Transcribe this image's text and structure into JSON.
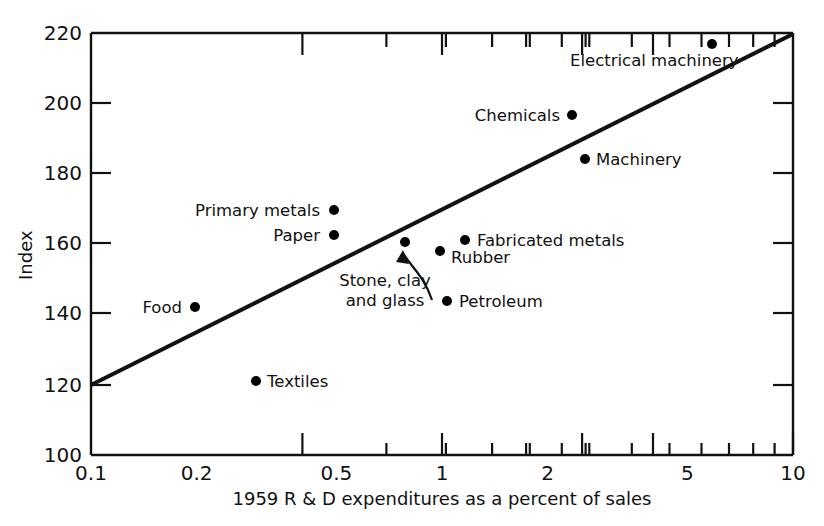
{
  "chart_data": {
    "type": "scatter",
    "title": "",
    "xlabel": "1959 R & D expenditures as a percent of sales",
    "ylabel": "Index",
    "xscale": "log",
    "yscale": "linear",
    "xlim": [
      0.1,
      10
    ],
    "ylim": [
      100,
      220
    ],
    "grid": false,
    "legend": "none",
    "xticks": [
      "0.1",
      "0.2",
      "0.5",
      "1",
      "2",
      "5",
      "10"
    ],
    "xtick_values": [
      0.1,
      0.2,
      0.5,
      1,
      2,
      5,
      10
    ],
    "xminor_ticks": [
      0.3,
      0.4,
      0.6,
      0.7,
      0.8,
      0.9,
      3,
      4,
      6,
      7,
      8,
      9
    ],
    "yticks": [
      "100",
      "120",
      "140",
      "160",
      "180",
      "200",
      "220"
    ],
    "ytick_values": [
      100,
      120,
      140,
      160,
      180,
      200,
      220
    ],
    "points": [
      {
        "label": "Electrical machinery",
        "x": 6.2,
        "y": 216.5,
        "label_side": "below"
      },
      {
        "label": "Chemicals",
        "x": 2.3,
        "y": 196,
        "label_side": "left"
      },
      {
        "label": "Machinery",
        "x": 2.55,
        "y": 183.5,
        "label_side": "right"
      },
      {
        "label": "Primary metals",
        "x": 0.5,
        "y": 170,
        "label_side": "left"
      },
      {
        "label": "Paper",
        "x": 0.5,
        "y": 163.5,
        "label_side": "left"
      },
      {
        "label": "Fabricated metals",
        "x": 1.2,
        "y": 161.5,
        "label_side": "right"
      },
      {
        "label": "Stone, clay and glass",
        "x": 0.82,
        "y": 161.5,
        "label_side": "annotation"
      },
      {
        "label": "Rubber",
        "x": 1.02,
        "y": 158.5,
        "label_side": "right"
      },
      {
        "label": "Petroleum",
        "x": 1.07,
        "y": 144,
        "label_side": "right"
      },
      {
        "label": "Food",
        "x": 0.195,
        "y": 142.8,
        "label_side": "left"
      },
      {
        "label": "Textiles",
        "x": 0.29,
        "y": 121,
        "label_side": "right"
      }
    ],
    "trendline": {
      "name": "fitted line",
      "x": [
        0.1,
        10
      ],
      "y": [
        120,
        220
      ]
    },
    "annotations": [
      {
        "text_line1": "Stone, clay",
        "text_line2": "and glass",
        "points_to": "Stone, clay and glass"
      }
    ]
  },
  "labels": {
    "y_axis_title": "Index",
    "x_axis_title": "1959 R & D expenditures as a percent of sales",
    "annotation_stone_line1": "Stone, clay",
    "annotation_stone_line2": "and glass",
    "pt_electrical_machinery": "Electrical machinery",
    "pt_chemicals": "Chemicals",
    "pt_machinery": "Machinery",
    "pt_primary_metals": "Primary metals",
    "pt_paper": "Paper",
    "pt_fabricated_metals": "Fabricated metals",
    "pt_rubber": "Rubber",
    "pt_petroleum": "Petroleum",
    "pt_food": "Food",
    "pt_textiles": "Textiles",
    "ytick_220": "220",
    "ytick_200": "200",
    "ytick_180": "180",
    "ytick_160": "160",
    "ytick_140": "140",
    "ytick_120": "120",
    "ytick_100": "100",
    "xtick_01": "0.1",
    "xtick_02": "0.2",
    "xtick_05": "0.5",
    "xtick_1": "1",
    "xtick_2": "2",
    "xtick_5": "5",
    "xtick_10": "10"
  },
  "colors": {
    "ink": "#111111",
    "background": "#ffffff",
    "marker": "#000000"
  }
}
